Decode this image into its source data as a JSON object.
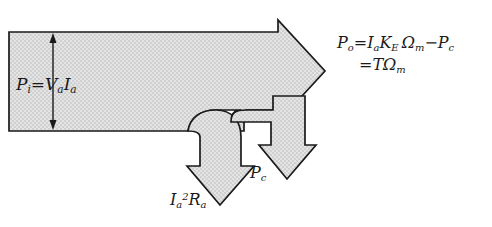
{
  "diagram": {
    "type": "power-flow-arrow-diagram",
    "background_color": "#ffffff",
    "arrow_fill_color": "#dcdcdc",
    "arrow_outline_color": "#1a1a1a",
    "text_color": "#1a1a1a"
  },
  "labels": {
    "input": {
      "name": "input-power",
      "symbol": "P",
      "symbol_sub": "i",
      "equals": "=",
      "term1": "V",
      "term1_sub": "a",
      "term2": "I",
      "term2_sub": "a",
      "plain": "P_i = V_a I_a"
    },
    "output": {
      "name": "output-power",
      "line1": {
        "symbol": "P",
        "symbol_sub": "o",
        "equals": "=",
        "t1": "I",
        "t1_sub": "a",
        "t2": "K",
        "t2_sub": "E",
        "t3": "Ω",
        "t3_sub": "m",
        "minus": "−",
        "t4": "P",
        "t4_sub": "c"
      },
      "line2": {
        "equals": "=",
        "t1": "T",
        "t2": "Ω",
        "t2_sub": "m"
      },
      "plain": "P_o = I_a K_E Ω_m − P_c = T Ω_m"
    },
    "copper_loss": {
      "name": "armature-copper-loss",
      "t1": "I",
      "t1_sub": "a",
      "t1_sup": "2",
      "t2": "R",
      "t2_sub": "a",
      "plain": "I_a^2 R_a"
    },
    "core_loss": {
      "name": "core-loss",
      "symbol": "P",
      "symbol_sub": "c",
      "plain": "P_c"
    }
  },
  "arrows": {
    "main": "horizontal-right-arrow",
    "branch_1": "curved-down-arrow-copper-loss",
    "branch_2": "curved-down-arrow-core-loss",
    "dimension": "vertical-double-headed-dimension-arrow"
  }
}
